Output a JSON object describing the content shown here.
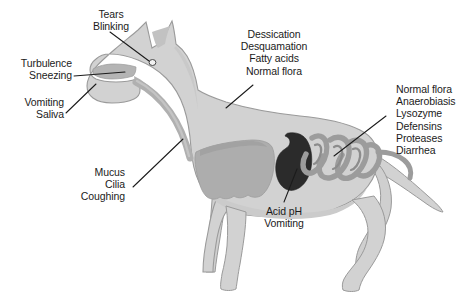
{
  "figure": {
    "background_color": "#ffffff",
    "line_color": "#1b1b1b",
    "text_color": "#1b1b1b"
  },
  "palette": {
    "body_fill": "#d2d2d2",
    "body_stroke": "#9a9a9a",
    "organ_mid": "#a8a8a8",
    "organ_dark": "#8e8e8e",
    "lung_fill": "#b0b0b0",
    "stomach_fill": "#2b2b2b",
    "intestine_fill": "#9c9c9c",
    "trachea_fill": "#b8b8b8"
  },
  "annotations": [
    {
      "id": "tears-blinking",
      "align": "center",
      "lines": [
        "Tears",
        "Blinking"
      ],
      "target": "eye"
    },
    {
      "id": "turbulence-sneezing",
      "align": "right",
      "lines": [
        "Turbulence",
        "Sneezing"
      ],
      "target": "nasal-cavity"
    },
    {
      "id": "vomiting-saliva",
      "align": "right",
      "lines": [
        "Vomiting",
        "Saliva"
      ],
      "target": "mouth"
    },
    {
      "id": "skin-defenses",
      "align": "center",
      "lines": [
        "Dessication",
        "Desquamation",
        "Fatty acids",
        "Normal flora"
      ],
      "target": "skin-back"
    },
    {
      "id": "mucus-cilia-coughing",
      "align": "right",
      "lines": [
        "Mucus",
        "Cilia",
        "Coughing"
      ],
      "target": "trachea"
    },
    {
      "id": "intestinal-defenses",
      "align": "left",
      "lines": [
        "Normal flora",
        "Anaerobiasis",
        "Lysozyme",
        "Defensins",
        "Proteases",
        "Diarrhea"
      ],
      "target": "intestines"
    },
    {
      "id": "acid-ph-vomiting",
      "align": "center",
      "lines": [
        "Acid pH",
        "Vomiting"
      ],
      "target": "stomach"
    }
  ],
  "organs": [
    {
      "id": "eye",
      "label": "eye"
    },
    {
      "id": "nasal-cavity",
      "label": "nasal cavity"
    },
    {
      "id": "trachea",
      "label": "trachea"
    },
    {
      "id": "lung",
      "label": "lung"
    },
    {
      "id": "stomach",
      "label": "stomach"
    },
    {
      "id": "intestines",
      "label": "intestines"
    },
    {
      "id": "colon",
      "label": "colon"
    }
  ]
}
